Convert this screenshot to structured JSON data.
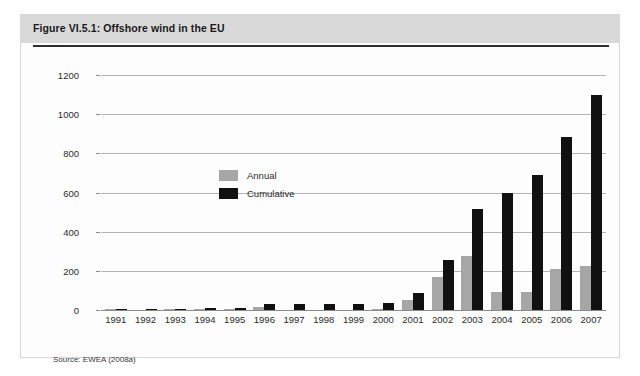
{
  "figure": {
    "title": "Figure VI.5.1: Offshore wind in the EU",
    "source": "Source: EWEA (2008a)"
  },
  "chart_data": {
    "type": "bar",
    "title": "Offshore wind in the EU",
    "xlabel": "",
    "ylabel": "",
    "ylim": [
      0,
      1200
    ],
    "yticks": [
      0,
      200,
      400,
      600,
      800,
      1000,
      1200
    ],
    "grid": true,
    "legend_position": "inside-top-left",
    "categories": [
      "1991",
      "1992",
      "1993",
      "1994",
      "1995",
      "1996",
      "1997",
      "1998",
      "1999",
      "2000",
      "2001",
      "2002",
      "2003",
      "2004",
      "2005",
      "2006",
      "2007"
    ],
    "series": [
      {
        "name": "Annual",
        "color": "#a6a6a6",
        "values": [
          5,
          0,
          2,
          2,
          5,
          17,
          0,
          0,
          0,
          4,
          51,
          170,
          276,
          90,
          94,
          208,
          225
        ]
      },
      {
        "name": "Cumulative",
        "color": "#111111",
        "values": [
          5,
          5,
          7,
          9,
          12,
          29,
          29,
          29,
          32,
          36,
          86,
          256,
          515,
          600,
          690,
          885,
          1100
        ]
      }
    ]
  }
}
